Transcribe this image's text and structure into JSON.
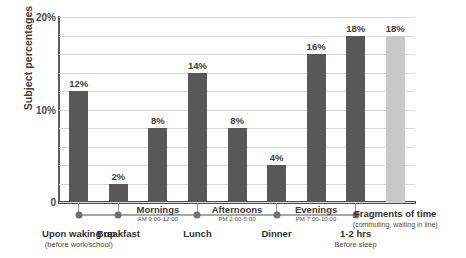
{
  "chart_data": {
    "type": "bar",
    "title": "",
    "xlabel": "",
    "ylabel": "Subject percentages",
    "ylim": [
      0,
      20
    ],
    "grid": true,
    "legend": "none",
    "categories": [
      "Upon waking up",
      "Breakfast",
      "Mornings",
      "Lunch",
      "Afternoons",
      "Dinner",
      "Evenings",
      "1-2 hrs Before sleep",
      "Fragments of time"
    ],
    "values": [
      12,
      2,
      8,
      14,
      8,
      4,
      16,
      18,
      18
    ],
    "bar_labels": [
      "12%",
      "2%",
      "8%",
      "14%",
      "8%",
      "4%",
      "16%",
      "18%",
      "18%"
    ],
    "bar_colors": [
      "#585858",
      "#585858",
      "#585858",
      "#585858",
      "#585858",
      "#585858",
      "#585858",
      "#585858",
      "#c8c8c8"
    ],
    "y_ticks": [
      0,
      10,
      20
    ],
    "y_tick_labels": [
      "0",
      "10%",
      "20%"
    ],
    "gridline_step": 2
  },
  "axis": {
    "y_title": "Subject percentages",
    "ticks": [
      {
        "value": 20,
        "label": "20%"
      },
      {
        "value": 10,
        "label": "10%"
      },
      {
        "value": 0,
        "label": "0"
      }
    ]
  },
  "bars": [
    {
      "label": "12%",
      "value": 12,
      "tone": "dark"
    },
    {
      "label": "2%",
      "value": 2,
      "tone": "dark"
    },
    {
      "label": "8%",
      "value": 8,
      "tone": "dark"
    },
    {
      "label": "14%",
      "value": 14,
      "tone": "dark"
    },
    {
      "label": "8%",
      "value": 8,
      "tone": "dark"
    },
    {
      "label": "4%",
      "value": 4,
      "tone": "dark"
    },
    {
      "label": "16%",
      "value": 16,
      "tone": "dark"
    },
    {
      "label": "18%",
      "value": 18,
      "tone": "dark"
    },
    {
      "label": "18%",
      "value": 18,
      "tone": "light"
    }
  ],
  "timeline": {
    "points": [
      {
        "name": "Upon waking up",
        "sub": "(before work/school)"
      },
      {
        "name": "Breakfast",
        "sub": ""
      },
      {
        "name": "Lunch",
        "sub": ""
      },
      {
        "name": "Dinner",
        "sub": ""
      },
      {
        "name": "1-2 hrs",
        "sub": "Before sleep"
      }
    ],
    "periods": [
      {
        "name": "Mornings",
        "time": "AM 9:00-12:00"
      },
      {
        "name": "Afternoons",
        "time": "PM 2:00-5:00"
      },
      {
        "name": "Evenings",
        "time": "PM 7:00-10:00"
      }
    ],
    "fragments": {
      "name": "Fragments of time",
      "sub": "(commuting, waiting in line)"
    }
  },
  "colors": {
    "bar_dark": "#585858",
    "bar_light": "#c8c8c8",
    "gridline": "#d9d9d9",
    "axis": "#4b4d50",
    "text": "#3a3a3a"
  }
}
